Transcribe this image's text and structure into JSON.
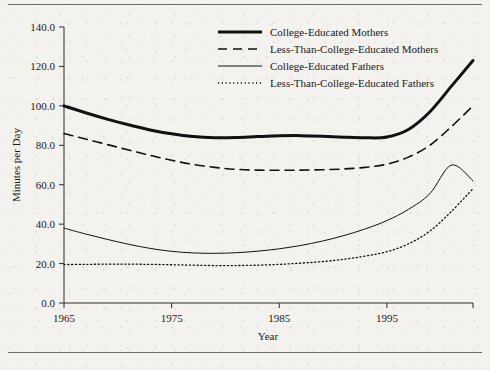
{
  "figure": {
    "background_color": "#f4f2ee",
    "line_color": "#111111",
    "axis_color": "#2b2b2b",
    "rule_color": "#6d6d6d"
  },
  "axes": {
    "x_title": "Year",
    "y_title": "Minutes per Day",
    "x_ticks": [
      "1965",
      "1975",
      "1985",
      "1995"
    ],
    "y_ticks": [
      "0.0",
      "20.0",
      "40.0",
      "60.0",
      "80.0",
      "100.0",
      "120.0",
      "140.0"
    ]
  },
  "legend": {
    "entries": [
      {
        "label": "College-Educated Mothers",
        "style": "thick-solid"
      },
      {
        "label": "Less-Than-College-Educated Mothers",
        "style": "dashed"
      },
      {
        "label": "College-Educated Fathers",
        "style": "thin-solid"
      },
      {
        "label": "Less-Than-College-Educated Fathers",
        "style": "dotted"
      }
    ]
  },
  "chart_data": {
    "type": "line",
    "title": "",
    "xlabel": "Year",
    "ylabel": "Minutes per Day",
    "xlim": [
      1965,
      2003
    ],
    "ylim": [
      0,
      140
    ],
    "x_ticks": [
      1965,
      1975,
      1985,
      1995
    ],
    "y_ticks": [
      0,
      20,
      40,
      60,
      80,
      100,
      120,
      140
    ],
    "grid": false,
    "legend_position": "top-right",
    "x": [
      1965,
      1967,
      1969,
      1971,
      1973,
      1975,
      1977,
      1979,
      1981,
      1983,
      1985,
      1987,
      1989,
      1991,
      1993,
      1995,
      1997,
      1999,
      2001,
      2003
    ],
    "series": [
      {
        "name": "College-Educated Mothers",
        "style": "thick-solid",
        "values": [
          100.0,
          96.5,
          93.3,
          90.4,
          87.8,
          85.8,
          84.4,
          83.8,
          83.9,
          84.4,
          84.8,
          84.9,
          84.6,
          84.1,
          83.8,
          84.2,
          88.0,
          97.0,
          110.0,
          123.0
        ]
      },
      {
        "name": "Less-Than-College-Educated Mothers",
        "style": "dashed",
        "values": [
          86.0,
          83.2,
          80.4,
          77.6,
          74.9,
          72.4,
          70.3,
          68.8,
          67.8,
          67.4,
          67.3,
          67.4,
          67.6,
          68.0,
          68.8,
          70.4,
          74.0,
          80.0,
          89.5,
          100.0
        ]
      },
      {
        "name": "College-Educated Fathers",
        "style": "thin-solid",
        "values": [
          38.0,
          35.0,
          32.3,
          29.8,
          27.7,
          26.2,
          25.4,
          25.2,
          25.5,
          26.3,
          27.5,
          29.2,
          31.4,
          34.2,
          37.6,
          41.8,
          47.5,
          55.5,
          70.0,
          62.0
        ]
      },
      {
        "name": "Less-Than-College-Educated Fathers",
        "style": "dotted",
        "values": [
          19.5,
          19.6,
          19.7,
          19.7,
          19.6,
          19.4,
          19.2,
          19.0,
          19.0,
          19.2,
          19.6,
          20.2,
          21.0,
          22.2,
          23.8,
          26.0,
          30.0,
          36.5,
          46.5,
          58.0
        ]
      }
    ]
  }
}
